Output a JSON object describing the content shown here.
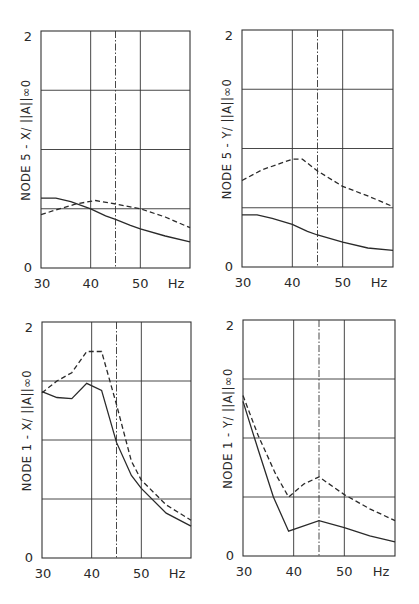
{
  "chart_data": [
    {
      "id": "node5-x",
      "type": "line",
      "title": "",
      "xlabel": "Hz",
      "ylabel": "NODE 5 - X/ ||A||∞0",
      "xlim": [
        30,
        60
      ],
      "ylim": [
        0,
        2
      ],
      "x_ticks": [
        "30",
        "40",
        "50",
        "Hz"
      ],
      "y_ticks": [
        "0",
        "2"
      ],
      "x_gridlines": [
        40,
        50
      ],
      "y_gridlines": [
        0.5,
        1.0,
        1.5
      ],
      "marker_line_x": 45,
      "grid": true,
      "legend": "none",
      "frame": {
        "left": 41,
        "right": 190,
        "top": 31,
        "bottom": 268
      },
      "series": [
        {
          "name": "solid",
          "style": "solid",
          "x": [
            30,
            33,
            36,
            40,
            43,
            45,
            48,
            50,
            55,
            60
          ],
          "values": [
            0.59,
            0.59,
            0.56,
            0.5,
            0.44,
            0.41,
            0.36,
            0.33,
            0.27,
            0.22
          ]
        },
        {
          "name": "dashed",
          "style": "dashed",
          "x": [
            30,
            33,
            37,
            41,
            45,
            50,
            55,
            60
          ],
          "values": [
            0.45,
            0.49,
            0.54,
            0.57,
            0.54,
            0.5,
            0.43,
            0.34
          ]
        }
      ]
    },
    {
      "id": "node5-y",
      "type": "line",
      "title": "",
      "xlabel": "Hz",
      "ylabel": "NODE 5 - Y/ ||A||∞0",
      "xlim": [
        30,
        60
      ],
      "ylim": [
        0,
        2
      ],
      "x_ticks": [
        "30",
        "40",
        "50",
        "Hz"
      ],
      "y_ticks": [
        "0",
        "2"
      ],
      "x_gridlines": [
        40,
        50
      ],
      "y_gridlines": [
        0.5,
        1.0,
        1.5
      ],
      "marker_line_x": 45,
      "grid": true,
      "legend": "none",
      "frame": {
        "left": 242,
        "right": 393,
        "top": 30,
        "bottom": 267
      },
      "series": [
        {
          "name": "solid",
          "style": "solid",
          "x": [
            30,
            33,
            36,
            40,
            43,
            45,
            50,
            55,
            60
          ],
          "values": [
            0.44,
            0.44,
            0.41,
            0.36,
            0.3,
            0.27,
            0.21,
            0.16,
            0.14
          ]
        },
        {
          "name": "dashed",
          "style": "dashed",
          "x": [
            30,
            34,
            40,
            42,
            45,
            50,
            55,
            60
          ],
          "values": [
            0.73,
            0.82,
            0.91,
            0.91,
            0.81,
            0.68,
            0.6,
            0.51
          ]
        }
      ]
    },
    {
      "id": "node1-x",
      "type": "line",
      "title": "",
      "xlabel": "Hz",
      "ylabel": "NODE 1 - X/ ||A||∞0",
      "xlim": [
        30,
        60
      ],
      "ylim": [
        0,
        2
      ],
      "x_ticks": [
        "30",
        "40",
        "50",
        "Hz"
      ],
      "y_ticks": [
        "0",
        "2"
      ],
      "x_gridlines": [
        40,
        50
      ],
      "y_gridlines": [
        0.5,
        1.0,
        1.5
      ],
      "marker_line_x": 45,
      "grid": true,
      "legend": "none",
      "frame": {
        "left": 42,
        "right": 191,
        "top": 322,
        "bottom": 558
      },
      "series": [
        {
          "name": "solid",
          "style": "solid",
          "x": [
            30,
            33,
            36,
            39,
            42,
            45,
            48,
            50,
            55,
            60
          ],
          "values": [
            1.41,
            1.36,
            1.35,
            1.48,
            1.42,
            0.98,
            0.7,
            0.59,
            0.38,
            0.27
          ]
        },
        {
          "name": "dashed",
          "style": "dashed",
          "x": [
            30,
            33,
            36,
            39,
            42,
            45,
            48,
            50,
            55,
            60
          ],
          "values": [
            1.4,
            1.5,
            1.57,
            1.75,
            1.75,
            1.3,
            0.82,
            0.66,
            0.45,
            0.32
          ]
        }
      ]
    },
    {
      "id": "node1-y",
      "type": "line",
      "title": "",
      "xlabel": "Hz",
      "ylabel": "NODE 1 - Y/ ||A||∞0",
      "xlim": [
        30,
        60
      ],
      "ylim": [
        0,
        2
      ],
      "x_ticks": [
        "30",
        "40",
        "50",
        "Hz"
      ],
      "y_ticks": [
        "0",
        "2"
      ],
      "x_gridlines": [
        40,
        50
      ],
      "y_gridlines": [
        0.5,
        1.0,
        1.5
      ],
      "marker_line_x": 45,
      "grid": true,
      "legend": "none",
      "frame": {
        "left": 243,
        "right": 395,
        "top": 320,
        "bottom": 556
      },
      "series": [
        {
          "name": "solid",
          "style": "solid",
          "x": [
            30,
            33,
            36,
            39,
            45,
            50,
            55,
            60
          ],
          "values": [
            1.31,
            0.9,
            0.5,
            0.21,
            0.3,
            0.24,
            0.17,
            0.12
          ]
        },
        {
          "name": "dashed",
          "style": "dashed",
          "x": [
            30,
            33,
            36.5,
            39,
            42,
            45,
            50,
            55,
            60
          ],
          "values": [
            1.36,
            1.02,
            0.69,
            0.5,
            0.61,
            0.67,
            0.52,
            0.4,
            0.3
          ]
        }
      ]
    }
  ]
}
